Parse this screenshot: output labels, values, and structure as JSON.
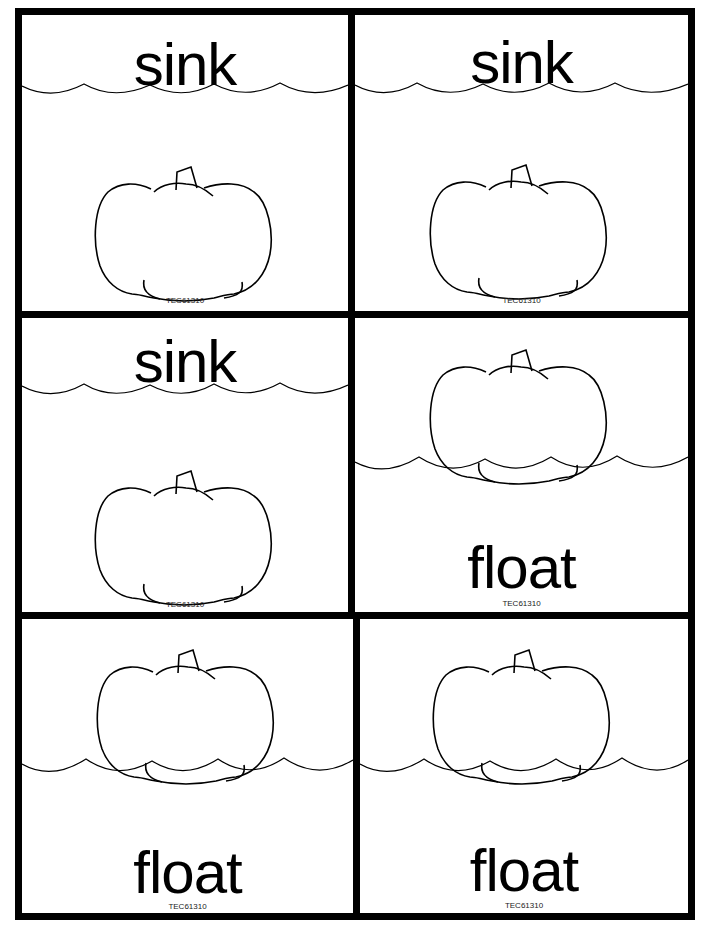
{
  "worksheet": {
    "grid": {
      "rows": 3,
      "columns": 2,
      "border_color": "#000000"
    },
    "cards": [
      {
        "word": "sink",
        "type": "sink",
        "code": "TEC61310"
      },
      {
        "word": "sink",
        "type": "sink",
        "code": "TEC61310"
      },
      {
        "word": "sink",
        "type": "sink",
        "code": "TEC61310"
      },
      {
        "word": "float",
        "type": "float",
        "code": "TEC61310"
      },
      {
        "word": "float",
        "type": "float",
        "code": "TEC61310"
      },
      {
        "word": "float",
        "type": "float",
        "code": "TEC61310"
      }
    ],
    "icons": [
      "pumpkin-icon",
      "water-wave-icon"
    ]
  }
}
